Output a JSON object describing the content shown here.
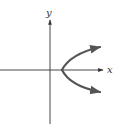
{
  "diagram": {
    "axes": {
      "x_label": "x",
      "y_label": "y",
      "color": "#333333"
    },
    "curve": {
      "type": "parabola",
      "opens": "right",
      "vertex_on": "positive x-axis",
      "arrows_on_both_ends": true,
      "color": "#555555"
    }
  }
}
